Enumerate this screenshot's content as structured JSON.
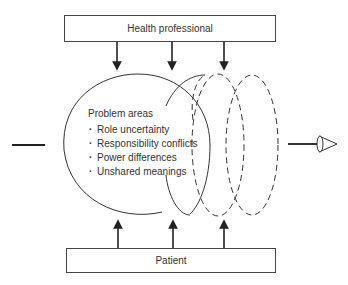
{
  "diagram": {
    "top_box": {
      "label": "Health professional"
    },
    "bottom_box": {
      "label": "Patient"
    },
    "problem_areas": {
      "title": "Problem areas",
      "items": [
        "Role uncertainty",
        "Responsibility conflicts",
        "Power differences",
        "Unshared meanings"
      ]
    },
    "arrows_down_count": 3,
    "arrows_up_count": 3,
    "spiral": {
      "solid_loops": 1,
      "dashed_loops": 2
    },
    "input_line": "line-left",
    "output_arrow": "cone-arrow-right",
    "colors": {
      "stroke": "#333333",
      "background": "#ffffff"
    }
  }
}
